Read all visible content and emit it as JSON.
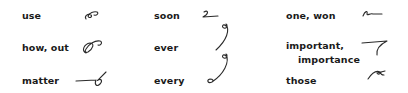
{
  "entries": [
    {
      "word": "use",
      "glyph": "use-outline"
    },
    {
      "word": "how, out",
      "glyph": "how-out-outline"
    },
    {
      "word": "matter",
      "glyph": "matter-outline"
    },
    {
      "word": "soon",
      "glyph": "soon-outline"
    },
    {
      "word": "ever",
      "glyph": "ever-outline"
    },
    {
      "word": "every",
      "glyph": "every-outline"
    },
    {
      "word": "one, won",
      "glyph": "one-won-outline"
    },
    {
      "word": "important,",
      "word_line2": "importance",
      "glyph": "important-importance-outline"
    },
    {
      "word": "those",
      "glyph": "those-outline"
    }
  ],
  "colors": {
    "text": "#1a1a1a",
    "stroke": "#2a2a2a",
    "background": "#ffffff"
  }
}
